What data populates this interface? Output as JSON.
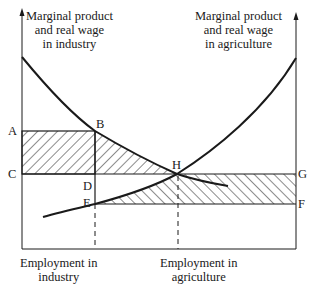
{
  "diagram": {
    "type": "two-sector labour market (industry vs agriculture)",
    "axes": {
      "left_axis_label": [
        "Marginal product",
        "and real wage",
        "in industry"
      ],
      "right_axis_label": [
        "Marginal product",
        "and real wage",
        "in agriculture"
      ],
      "bottom_left_label": [
        "Employment in",
        "industry"
      ],
      "bottom_right_label": [
        "Employment in",
        "agriculture"
      ]
    },
    "points": {
      "A": "A",
      "B": "B",
      "C": "C",
      "D": "D",
      "E": "E",
      "F": "F",
      "G": "G",
      "H": "H"
    },
    "curves": [
      {
        "name": "marginal-product-industry",
        "description": "downward sloping from left axis through B and H"
      },
      {
        "name": "marginal-product-agriculture",
        "description": "upward sloping curve through E and H to right axis"
      },
      {
        "name": "agriculture-curve-tail",
        "description": "short extension beyond H"
      }
    ],
    "shaded_regions": [
      {
        "name": "rectangle-ABDC",
        "vertices": [
          "A",
          "B",
          "D",
          "C"
        ]
      },
      {
        "name": "triangle-BH-D",
        "vertices": [
          "B",
          "H",
          "D"
        ]
      },
      {
        "name": "rectangle-EHGF",
        "vertices": [
          "E",
          "H",
          "G",
          "F"
        ]
      }
    ],
    "colors": {
      "ink": "#1a1a1a",
      "background": "#ffffff"
    }
  }
}
